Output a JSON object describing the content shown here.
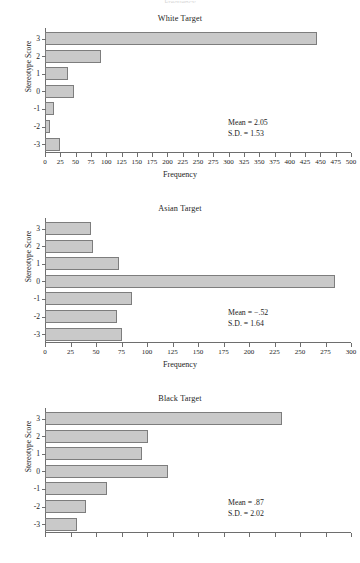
{
  "figure": {
    "background": "#ffffff",
    "bar_fill": "#c9c9c9",
    "bar_stroke": "#7d7d7d",
    "axis_color": "#6e6e6e",
    "text_color": "#242424",
    "ylabel": "Stereotype Score",
    "xlabel": "Frequency",
    "cut_off_top_text": "Frequency"
  },
  "chart_data": [
    {
      "type": "bar",
      "orientation": "horizontal",
      "id": "white-target",
      "title": "White Target",
      "xlabel": "Frequency",
      "ylabel": "Stereotype Score",
      "categories": [
        "3",
        "2",
        "1",
        "0",
        "-1",
        "-2",
        "-3"
      ],
      "values": [
        445,
        92,
        38,
        48,
        14,
        8,
        24
      ],
      "xlim": [
        0,
        500
      ],
      "xticks": [
        0,
        25,
        50,
        75,
        100,
        125,
        150,
        175,
        200,
        225,
        250,
        275,
        300,
        325,
        350,
        375,
        400,
        425,
        450,
        475,
        500
      ],
      "xticklabels": [
        "0",
        "25",
        "50",
        "75",
        "100",
        "125",
        "150",
        "175",
        "200",
        "225",
        "250",
        "275",
        "300",
        "325",
        "350",
        "375",
        "400",
        "425",
        "450",
        "475",
        "500"
      ],
      "grid": false,
      "legend": null,
      "annotations": {
        "mean_label": "Mean = 2.05",
        "sd_label": "S.D. = 1.53",
        "mean": 2.05,
        "sd": 1.53
      }
    },
    {
      "type": "bar",
      "orientation": "horizontal",
      "id": "asian-target",
      "title": "Asian Target",
      "xlabel": "Frequency",
      "ylabel": "Stereotype Score",
      "categories": [
        "3",
        "2",
        "1",
        "0",
        "-1",
        "-2",
        "-3"
      ],
      "values": [
        45,
        47,
        73,
        284,
        85,
        71,
        75
      ],
      "xlim": [
        0,
        300
      ],
      "xticks": [
        0,
        25,
        50,
        75,
        100,
        125,
        150,
        175,
        200,
        225,
        250,
        275,
        300
      ],
      "xticklabels": [
        "0",
        "25",
        "50",
        "75",
        "100",
        "125",
        "150",
        "175",
        "200",
        "225",
        "250",
        "275",
        "300"
      ],
      "grid": false,
      "legend": null,
      "annotations": {
        "mean_label": "Mean = −.52",
        "sd_label": "S.D. = 1.64",
        "mean": -0.52,
        "sd": 1.64
      }
    },
    {
      "type": "bar",
      "orientation": "horizontal",
      "id": "black-target",
      "title": "Black Target",
      "xlabel": "Frequency",
      "ylabel": "Stereotype Score",
      "categories": [
        "3",
        "2",
        "1",
        "0",
        "-1",
        "-2",
        "-3"
      ],
      "values": [
        232,
        101,
        95,
        121,
        61,
        40,
        31
      ],
      "xlim": [
        0,
        300
      ],
      "xticks": [
        0,
        25,
        50,
        75,
        100,
        125,
        150,
        175,
        200,
        225,
        250,
        275,
        300
      ],
      "xticklabels": [
        "0",
        "25",
        "50",
        "75",
        "100",
        "125",
        "150",
        "175",
        "200",
        "225",
        "250",
        "275",
        "300"
      ],
      "grid": false,
      "legend": null,
      "annotations": {
        "mean_label": "Mean = .87",
        "sd_label": "S.D. = 2.02",
        "mean": 0.87,
        "sd": 2.02
      }
    }
  ]
}
